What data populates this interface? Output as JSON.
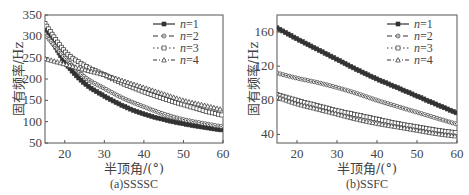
{
  "chart_data": [
    {
      "type": "line",
      "title": "",
      "caption": "(a)SSSSC",
      "xlabel": "半顶角/(°)",
      "ylabel": "固有频率/Hz",
      "xlim": [
        15,
        60
      ],
      "ylim": [
        50,
        350
      ],
      "xticks": [
        20,
        30,
        40,
        50,
        60
      ],
      "yticks": [
        50,
        100,
        150,
        200,
        250,
        300,
        350
      ],
      "grid": false,
      "legend_position": "upper right",
      "x": [
        15,
        20,
        25,
        30,
        35,
        40,
        45,
        50,
        55,
        60
      ],
      "series": [
        {
          "name": "n=1",
          "marker": "square-filled",
          "line": "solid",
          "values": [
            320,
            240,
            190,
            160,
            136,
            118,
            105,
            95,
            87,
            80
          ]
        },
        {
          "name": "n=2",
          "marker": "circle-dot",
          "line": "dashed",
          "values": [
            305,
            250,
            205,
            178,
            154,
            135,
            118,
            105,
            96,
            88
          ]
        },
        {
          "name": "n=3",
          "marker": "square-open",
          "line": "dotted",
          "values": [
            330,
            265,
            232,
            210,
            188,
            170,
            154,
            140,
            126,
            115
          ]
        },
        {
          "name": "n=4",
          "marker": "triangle-open",
          "line": "dash-dot",
          "values": [
            248,
            235,
            222,
            210,
            195,
            180,
            165,
            150,
            139,
            128
          ]
        }
      ]
    },
    {
      "type": "line",
      "title": "",
      "caption": "(b)SSFC",
      "xlabel": "半顶角/(°)",
      "ylabel": "固有频率/Hz",
      "xlim": [
        15,
        60
      ],
      "ylim": [
        30,
        180
      ],
      "xticks": [
        20,
        30,
        40,
        50,
        60
      ],
      "yticks": [
        40,
        80,
        120,
        160
      ],
      "grid": false,
      "legend_position": "upper right",
      "x": [
        15,
        20,
        25,
        30,
        35,
        40,
        45,
        50,
        55,
        60
      ],
      "series": [
        {
          "name": "n=1",
          "marker": "square-filled",
          "line": "solid",
          "values": [
            165,
            152,
            140,
            128,
            116,
            105,
            95,
            85,
            75,
            65
          ]
        },
        {
          "name": "n=2",
          "marker": "circle-dot",
          "line": "dashed",
          "values": [
            112,
            106,
            101,
            95,
            88,
            80,
            73,
            66,
            59,
            52
          ]
        },
        {
          "name": "n=3",
          "marker": "square-open",
          "line": "dotted",
          "values": [
            87,
            80,
            74,
            68,
            63,
            58,
            53,
            49,
            45,
            42
          ]
        },
        {
          "name": "n=4",
          "marker": "triangle-open",
          "line": "dash-dot",
          "values": [
            84,
            76,
            70,
            64,
            58,
            53,
            49,
            45,
            41,
            38
          ]
        }
      ]
    }
  ],
  "legend": {
    "items": [
      {
        "prefix": "n",
        "label": "=1"
      },
      {
        "prefix": "n",
        "label": "=2"
      },
      {
        "prefix": "n",
        "label": "=3"
      },
      {
        "prefix": "n",
        "label": "=4"
      }
    ]
  }
}
